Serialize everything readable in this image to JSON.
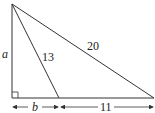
{
  "diagram": {
    "type": "right-triangle-with-cevian",
    "labels": {
      "left_side": "a",
      "cevian": "13",
      "hypotenuse": "20",
      "base_left_segment": "b",
      "base_right_segment": "11"
    },
    "right_angle_marker": true,
    "colors": {
      "stroke": "#333333",
      "text": "#222222"
    }
  }
}
